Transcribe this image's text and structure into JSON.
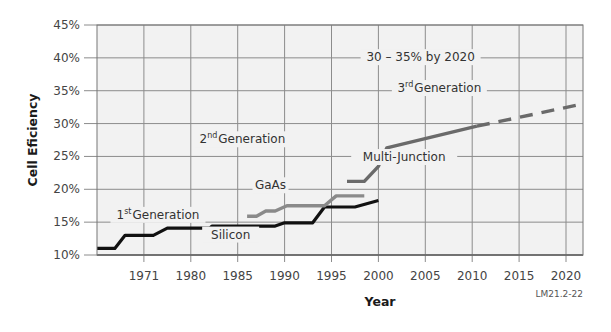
{
  "chart_data": {
    "type": "line",
    "title": "",
    "xlabel": "Year",
    "ylabel": "Cell Eficiency",
    "ylim": [
      10,
      45
    ],
    "y_ticks": [
      "10%",
      "15%",
      "20%",
      "25%",
      "30%",
      "35%",
      "40%",
      "45%"
    ],
    "y_tick_values": [
      10,
      15,
      20,
      25,
      30,
      35,
      40,
      45
    ],
    "x_ticks": [
      "1971",
      "1980",
      "1985",
      "1990",
      "1995",
      "2000",
      "2005",
      "2010",
      "2015",
      "2020"
    ],
    "x_note": "x positions are expressed in tick-index units: 0 = left plot edge, 1 = 1971, 2 = 1980, 3 = 1985, ... 10 = 2020; right edge ≈ 10.36",
    "xlim": [
      0,
      10.36
    ],
    "grid": true,
    "series": [
      {
        "name": "Silicon",
        "generation": "1st Generation",
        "color": "#111111",
        "style": "solid",
        "points": [
          [
            0,
            11
          ],
          [
            0.38,
            11
          ],
          [
            0.6,
            13
          ],
          [
            1.2,
            13
          ],
          [
            1.5,
            14.1
          ],
          [
            2.4,
            14.1
          ],
          [
            2.45,
            14.4
          ],
          [
            3.8,
            14.4
          ],
          [
            4.0,
            14.9
          ],
          [
            4.6,
            14.9
          ],
          [
            4.85,
            17.3
          ],
          [
            5.5,
            17.3
          ],
          [
            6.0,
            18.3
          ]
        ]
      },
      {
        "name": "GaAs",
        "generation": "2nd Generation",
        "color": "#8a8a8a",
        "style": "solid",
        "points": [
          [
            3.2,
            15.9
          ],
          [
            3.4,
            15.9
          ],
          [
            3.6,
            16.7
          ],
          [
            3.8,
            16.7
          ],
          [
            4.05,
            17.5
          ],
          [
            4.85,
            17.5
          ],
          [
            5.1,
            19.0
          ],
          [
            5.7,
            19.0
          ]
        ]
      },
      {
        "name": "Multi-Junction",
        "generation": "2nd Generation",
        "color": "#6a6a6a",
        "style": "solid",
        "points": [
          [
            5.33,
            21.2
          ],
          [
            5.7,
            21.2
          ],
          [
            6.0,
            23.5
          ],
          [
            6.18,
            26.3
          ],
          [
            8.1,
            29.6
          ]
        ]
      },
      {
        "name": "Multi-Junction projection",
        "generation": "3rd Generation",
        "color": "#6a6a6a",
        "style": "dashed",
        "points": [
          [
            8.1,
            29.6
          ],
          [
            10.36,
            33.0
          ]
        ]
      }
    ],
    "annotations": [
      {
        "text": "30 – 35% by 2020",
        "x": 6.9,
        "y": 39.5
      },
      {
        "text_main": "Generation",
        "text_sup": "rd",
        "text_num": "3",
        "x": 7.3,
        "y": 34.8
      },
      {
        "text_main": "Generation",
        "text_sup": "nd",
        "text_num": "2",
        "x": 3.1,
        "y": 27.0
      },
      {
        "text": "Multi-Junction",
        "x": 6.55,
        "y": 24.3
      },
      {
        "text": "GaAs",
        "x": 3.7,
        "y": 20.0
      },
      {
        "text_main": "Generation",
        "text_sup": "st",
        "text_num": "1",
        "x": 1.3,
        "y": 15.5
      },
      {
        "text": "Silicon",
        "x": 2.85,
        "y": 12.5
      }
    ],
    "figure_code": "LM21.2-22"
  }
}
